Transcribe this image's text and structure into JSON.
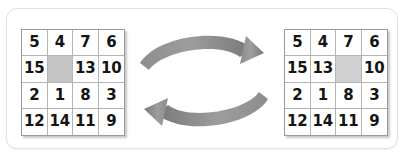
{
  "figure": {
    "width": 406,
    "height": 164,
    "background": "#ffffff",
    "frame_border_color": "#e3e3e3"
  },
  "colors": {
    "grid_line": "#b4b4b4",
    "grid_outline": "#9a9a9a",
    "blank_cell_left": "#c6c6c6",
    "blank_cell_right": "#d0d0d0",
    "arrow": "#808080",
    "numeral": "#141414"
  },
  "puzzles": [
    {
      "name": "before-state",
      "position": "left",
      "rows": 4,
      "columns": 4,
      "blank_cell_index": 5,
      "blank_cell_row": 2,
      "blank_cell_column": 2,
      "cells": [
        "5",
        "4",
        "7",
        "6",
        "15",
        "",
        "13",
        "10",
        "2",
        "1",
        "8",
        "3",
        "12",
        "14",
        "11",
        "9"
      ]
    },
    {
      "name": "after-state",
      "position": "right",
      "rows": 4,
      "columns": 4,
      "blank_cell_index": 6,
      "blank_cell_row": 2,
      "blank_cell_column": 3,
      "cells": [
        "5",
        "4",
        "7",
        "6",
        "15",
        "13",
        "",
        "10",
        "2",
        "1",
        "8",
        "3",
        "12",
        "14",
        "11",
        "9"
      ]
    }
  ],
  "arrows": [
    {
      "name": "forward-arrow",
      "direction": "right",
      "curve": "arc-up",
      "color": "#808080"
    },
    {
      "name": "reverse-arrow",
      "direction": "left",
      "curve": "arc-down",
      "color": "#808080"
    }
  ]
}
